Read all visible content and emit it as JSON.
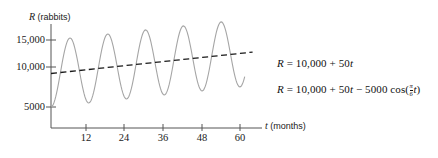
{
  "chart_data": {
    "type": "line",
    "title": "",
    "xlabel": "t (months)",
    "ylabel": "R (rabbits)",
    "xlabel_var": "t",
    "xlabel_unit": "(months)",
    "ylabel_var": "R",
    "ylabel_unit": "(rabbits)",
    "xlim": [
      0,
      66
    ],
    "ylim": [
      0,
      17000
    ],
    "grid": false,
    "legend_position": "right-inline",
    "xticks": [
      12,
      24,
      36,
      48,
      60
    ],
    "xtick_labels": [
      "12",
      "24",
      "36",
      "48",
      "60"
    ],
    "yticks": [
      5000,
      10000,
      15000
    ],
    "ytick_labels": [
      "5000",
      "10,000",
      "15,000"
    ],
    "series": [
      {
        "name": "R = 10,000 + 50t",
        "style": "dashed",
        "color": "#1a1a1a",
        "equation_text": "R = 10,000 + 50t",
        "formula": "10000 + 50*t",
        "points_t": [
          0,
          6,
          12,
          18,
          24,
          30,
          36,
          42,
          48,
          54,
          60
        ],
        "points_R": [
          10000,
          10300,
          10600,
          10900,
          11200,
          11500,
          11800,
          12100,
          12400,
          12700,
          13000
        ]
      },
      {
        "name": "R = 10,000 + 50t - 5000 cos(pi/6 t)",
        "style": "solid",
        "color": "#9a9a9a",
        "equation_text": "R = 10,000 + 50t − 5000 cos(π/6 t)",
        "formula": "10000 + 50*t - 5000*cos(pi*t/6)",
        "amplitude": 5000,
        "period_months": 12,
        "points_t": [
          0,
          3,
          6,
          9,
          12,
          15,
          18,
          21,
          24,
          27,
          30,
          33,
          36,
          39,
          42,
          45,
          48,
          51,
          54,
          57,
          60
        ],
        "points_R": [
          5000,
          10150,
          15300,
          10450,
          5600,
          10750,
          15900,
          11050,
          6200,
          11350,
          16500,
          11650,
          6800,
          11950,
          17100,
          12250,
          7400,
          12550,
          17700,
          12850,
          8000
        ]
      }
    ],
    "annotations": [
      {
        "id": "line-equation",
        "text": "R = 10,000 + 50t",
        "parts": {
          "lhs": "R",
          "eq": "=",
          "rhs": "10,000 + 50t"
        }
      },
      {
        "id": "curve-equation",
        "text": "R = 10,000 + 50t − 5000 cos(π/6 t)",
        "parts": {
          "lhs": "R",
          "eq": "=",
          "rhs_a": "10,000 + 50",
          "var1": "t",
          "minus": "−",
          "rhs_b": "5000 cos(",
          "frac_num": "π",
          "frac_den": "6",
          "var2": "t",
          "close": ")"
        }
      }
    ]
  }
}
